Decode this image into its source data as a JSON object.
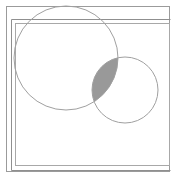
{
  "figure": {
    "title": "Two overlapping circles with shaded intersection inside nested rectangular frames",
    "type": "venn-diagram",
    "canvas": {
      "width": 176,
      "height": 178,
      "background": "#ffffff"
    },
    "colors": {
      "outer_frame_stroke": "#9b9b9b",
      "inner_frame_stroke": "#a8a8a8",
      "accent_rule_stroke": "#8f8f8f",
      "circle_stroke": "#a0a0a0",
      "intersection_fill": "#999999",
      "intersection_stroke": "#8a8a8a",
      "page_background": "#ffffff"
    },
    "strokes": {
      "outer_frame_width": 1,
      "inner_frame_width": 1,
      "accent_rule_width": 1,
      "circle_width": 1
    },
    "frames": [
      {
        "name": "outer-frame",
        "label": "Outer border rectangle",
        "x": 6,
        "y": 6,
        "width": 164,
        "height": 166
      },
      {
        "name": "inner-frame",
        "label": "Inner offset rectangle",
        "x": 15,
        "y": 23,
        "width": 155,
        "height": 143
      }
    ],
    "rules": [
      {
        "name": "left-accent-rule",
        "label": "Left vertical accent line",
        "orientation": "vertical",
        "x1": 11,
        "y1": 19,
        "x2": 11,
        "y2": 170
      },
      {
        "name": "top-accent-rule",
        "label": "Top horizontal accent line",
        "orientation": "horizontal",
        "x1": 11,
        "y1": 19,
        "x2": 170,
        "y2": 19
      },
      {
        "name": "bottom-accent-rule",
        "label": "Bottom horizontal accent line",
        "orientation": "horizontal",
        "x1": 11,
        "y1": 170,
        "x2": 170,
        "y2": 170
      }
    ],
    "circles": [
      {
        "name": "circle-large-left",
        "label": "Large left circle",
        "cx": 66,
        "cy": 58,
        "r": 52,
        "fill": "none",
        "stroke": "#a0a0a0"
      },
      {
        "name": "circle-small-right",
        "label": "Small right circle",
        "cx": 125,
        "cy": 90,
        "r": 33,
        "fill": "none",
        "stroke": "#a0a0a0"
      }
    ],
    "intersection": {
      "name": "intersection-lens",
      "label": "Shaded lens intersection region",
      "fill": "#999999",
      "opacity": 1,
      "point_upper": {
        "x": 102,
        "y": 58
      },
      "point_lower": {
        "x": 92,
        "y": 94
      }
    }
  }
}
